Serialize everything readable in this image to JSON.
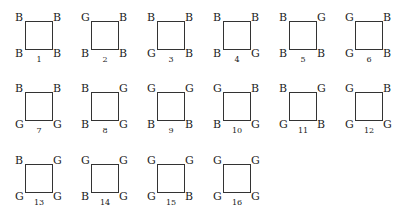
{
  "diagram": {
    "configurations": [
      {
        "number": "1",
        "tl": "B",
        "tr": "B",
        "bl": "B",
        "br": "B"
      },
      {
        "number": "2",
        "tl": "G",
        "tr": "B",
        "bl": "B",
        "br": "B"
      },
      {
        "number": "3",
        "tl": "B",
        "tr": "B",
        "bl": "G",
        "br": "B"
      },
      {
        "number": "4",
        "tl": "B",
        "tr": "B",
        "bl": "B",
        "br": "G"
      },
      {
        "number": "5",
        "tl": "B",
        "tr": "G",
        "bl": "B",
        "br": "B"
      },
      {
        "number": "6",
        "tl": "G",
        "tr": "B",
        "bl": "G",
        "br": "B"
      },
      {
        "number": "7",
        "tl": "B",
        "tr": "B",
        "bl": "G",
        "br": "G"
      },
      {
        "number": "8",
        "tl": "B",
        "tr": "G",
        "bl": "B",
        "br": "G"
      },
      {
        "number": "9",
        "tl": "G",
        "tr": "G",
        "bl": "B",
        "br": "B"
      },
      {
        "number": "10",
        "tl": "G",
        "tr": "B",
        "bl": "B",
        "br": "G"
      },
      {
        "number": "11",
        "tl": "B",
        "tr": "G",
        "bl": "G",
        "br": "B"
      },
      {
        "number": "12",
        "tl": "G",
        "tr": "B",
        "bl": "G",
        "br": "G"
      },
      {
        "number": "13",
        "tl": "B",
        "tr": "G",
        "bl": "G",
        "br": "G"
      },
      {
        "number": "14",
        "tl": "G",
        "tr": "G",
        "bl": "B",
        "br": "G"
      },
      {
        "number": "15",
        "tl": "G",
        "tr": "G",
        "bl": "G",
        "br": "B"
      },
      {
        "number": "16",
        "tl": "G",
        "tr": "G",
        "bl": "G",
        "br": "G"
      }
    ]
  }
}
